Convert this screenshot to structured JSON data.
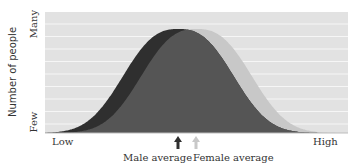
{
  "chart_data": {
    "type": "area",
    "title": "",
    "xlabel": "",
    "ylabel": "Number of people",
    "x_tick_labels": {
      "left": "Low",
      "right": "High"
    },
    "y_tick_labels": {
      "bottom": "Few",
      "top": "Many"
    },
    "grid": "horizontal",
    "series": [
      {
        "name": "Male",
        "color": "#2f2f2f",
        "mean_position": 0.44,
        "std_width": 0.17,
        "relative_peak": 1.0
      },
      {
        "name": "Female",
        "color": "#c8c8c8",
        "mean_position": 0.5,
        "std_width": 0.17,
        "relative_peak": 1.0
      }
    ],
    "overlap_color": "#555555",
    "annotations": [
      {
        "text": "Male average",
        "arrow_color": "#2f2f2f",
        "x_position": 0.44
      },
      {
        "text": "Female average",
        "arrow_color": "#c8c8c8",
        "x_position": 0.5
      }
    ],
    "background_color": "#e2e2e2"
  },
  "labels": {
    "y_axis": "Number of people",
    "y_top": "Many",
    "y_bottom": "Few",
    "x_left": "Low",
    "x_right": "High",
    "male_avg": "Male average",
    "female_avg": "Female average"
  }
}
